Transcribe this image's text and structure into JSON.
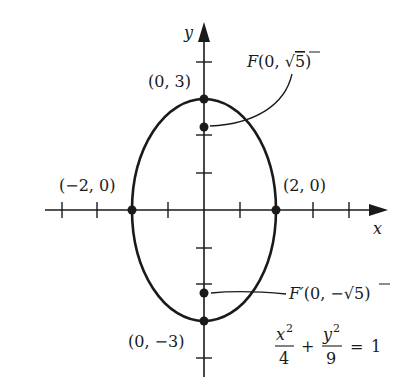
{
  "figure": {
    "type": "ellipse-graph",
    "colors": {
      "ink": "#1a1a1a",
      "background": "#ffffff"
    },
    "axes": {
      "x_label": "x",
      "y_label": "y"
    },
    "ellipse": {
      "a": 2,
      "b": 3,
      "center": [
        0,
        0
      ]
    },
    "vertex_labels": {
      "top": "(0, 3)",
      "bottom": "(0, −3)",
      "left": "(−2, 0)",
      "right": "(2, 0)"
    },
    "foci": {
      "upper": {
        "name": "F",
        "open": "(0, ",
        "radical": "√",
        "radicand": "5",
        "close": ")"
      },
      "lower": {
        "name": "F′",
        "open": "(0, −",
        "radical": "√",
        "radicand": "5",
        "close": ")"
      }
    },
    "equation": {
      "term1_num": "x",
      "term1_exp": "2",
      "term1_den": "4",
      "plus": "+",
      "term2_num": "y",
      "term2_exp": "2",
      "term2_den": "9",
      "equals": "=",
      "rhs": "1"
    }
  }
}
